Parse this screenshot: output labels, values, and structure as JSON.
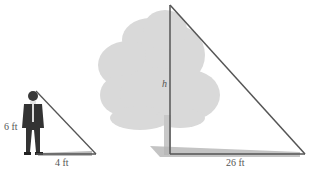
{
  "diagram": {
    "type": "similar-triangles",
    "person": {
      "height_label": "6 ft",
      "shadow_label": "4 ft"
    },
    "tree": {
      "height_label": "h",
      "shadow_label": "26 ft"
    },
    "caption": "Illustration"
  },
  "colors": {
    "line": "#555555",
    "tree": "#d6d6d6",
    "shadow": "#b8b8b8",
    "person_dark": "#333333",
    "background": "#ffffff"
  }
}
